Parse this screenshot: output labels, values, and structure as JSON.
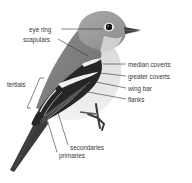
{
  "diagram": {
    "colors": {
      "body_gray": "#8f8f8f",
      "head_gray": "#9a9a9a",
      "wing_dark": "#2a2a2a",
      "belly": "#e9e9e9",
      "line": "#333333",
      "text": "#3a3a3a"
    },
    "labels": [
      {
        "id": "eye-ring",
        "text": "eye ring"
      },
      {
        "id": "scapulars",
        "text": "scapulars"
      },
      {
        "id": "median-coverts",
        "text": "median coverts"
      },
      {
        "id": "greater-coverts",
        "text": "greater coverts"
      },
      {
        "id": "wing-bar",
        "text": "wing bar"
      },
      {
        "id": "flanks",
        "text": "flanks"
      },
      {
        "id": "tertials",
        "text": "tertials"
      },
      {
        "id": "secondaries",
        "text": "secondaries"
      },
      {
        "id": "primaries",
        "text": "primaries"
      }
    ]
  }
}
